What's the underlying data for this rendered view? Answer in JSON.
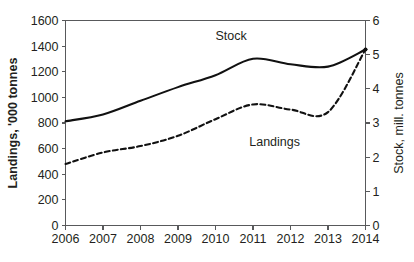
{
  "chart_data": {
    "type": "line",
    "title": "",
    "subtitle": "",
    "xlabel": "",
    "ylabel": "Landings, '000 tonnes",
    "y2label": "Stock, mill. tonnes",
    "grid": false,
    "legend_position": "inline-labels",
    "x": [
      2006,
      2007,
      2008,
      2009,
      2010,
      2011,
      2012,
      2013,
      2014
    ],
    "xtick_labels": [
      "2006",
      "2007",
      "2008",
      "2009",
      "2010",
      "2011",
      "2012",
      "2013",
      "2014"
    ],
    "xlim": [
      2006,
      2014
    ],
    "ylim": [
      0,
      1600
    ],
    "ytick_labels": [
      "0",
      "200",
      "400",
      "600",
      "800",
      "1000",
      "1200",
      "1400",
      "1600"
    ],
    "ytick_values": [
      0,
      200,
      400,
      600,
      800,
      1000,
      1200,
      1400,
      1600
    ],
    "y2lim": [
      0,
      6
    ],
    "y2tick_labels": [
      "0",
      "1",
      "2",
      "3",
      "4",
      "5",
      "6"
    ],
    "y2tick_values": [
      0,
      1,
      2,
      3,
      4,
      5,
      6
    ],
    "series": [
      {
        "name": "Stock",
        "label": "Stock",
        "axis": "right",
        "units": "mill. tonnes",
        "style": "solid",
        "color": "#111111",
        "values": [
          3.05,
          3.25,
          3.65,
          4.05,
          4.4,
          4.88,
          4.72,
          4.65,
          5.15
        ],
        "label_x": 2010.0,
        "label_y": 5.42
      },
      {
        "name": "Landings",
        "label": "Landings",
        "axis": "left",
        "units": "'000 tonnes",
        "style": "dashed",
        "color": "#111111",
        "values": [
          480,
          570,
          620,
          700,
          830,
          945,
          905,
          885,
          1375
        ],
        "label_x": 2010.9,
        "label_y": 620
      }
    ],
    "annotations": [
      {
        "text": "Stock",
        "series": "Stock"
      },
      {
        "text": "Landings",
        "series": "Landings"
      }
    ]
  },
  "colors": {
    "line": "#111111",
    "axis": "#58595b",
    "text": "#231f20",
    "background": "#ffffff"
  }
}
